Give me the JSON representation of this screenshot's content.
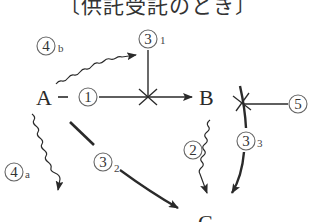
{
  "title": "〔供託受託のとき〕",
  "nodes": {
    "A": "A",
    "B": "B",
    "C": "C"
  },
  "labels": {
    "arrow_1": {
      "num": "1"
    },
    "arrow_2": {
      "num": "2"
    },
    "arrow_3_1": {
      "num": "3",
      "sub": "1"
    },
    "arrow_3_2": {
      "num": "3",
      "sub": "2"
    },
    "arrow_3_3": {
      "num": "3",
      "sub": "3"
    },
    "arrow_4a": {
      "num": "4",
      "sub": "a"
    },
    "arrow_4b": {
      "num": "4",
      "sub": "b"
    },
    "arrow_5": {
      "num": "5"
    }
  },
  "colors": {
    "line": "#2a2a2a",
    "circle": "#666666"
  }
}
